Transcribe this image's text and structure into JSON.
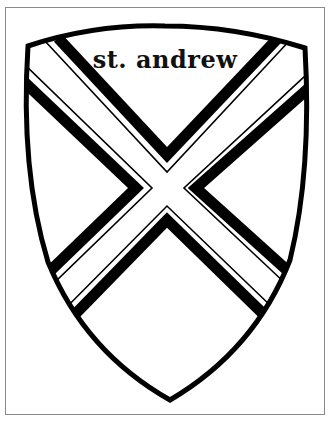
{
  "image": {
    "title_text": "st. andrew",
    "subject": "heraldic shield with saltire (St. Andrew's cross)",
    "style": "black line art coloring page",
    "colors": {
      "ink": "#000000",
      "paper": "#ffffff",
      "frame": "#8a8a8a"
    }
  }
}
